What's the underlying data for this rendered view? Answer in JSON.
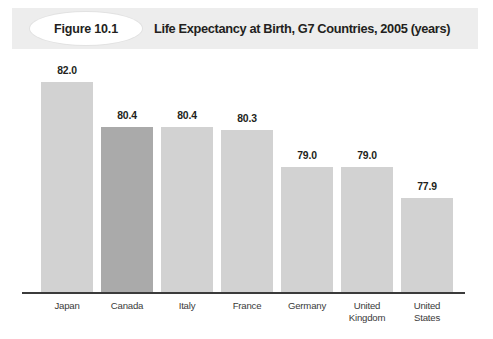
{
  "header": {
    "figure_number": "Figure 10.1",
    "title": "Life Expectancy at Birth, G7 Countries, 2005 (years)",
    "band_color": "#ededed",
    "badge_shape": "ellipse-badge"
  },
  "colors": {
    "bar_default": "#d2d2d2",
    "bar_highlight": "#aaaaaa",
    "axis": "#3b3b3b",
    "text": "#231f20"
  },
  "chart_data": {
    "type": "bar",
    "title": "Life Expectancy at Birth, G7 Countries, 2005 (years)",
    "xlabel": "",
    "ylabel": "",
    "ylim": [
      74.5,
      82.8
    ],
    "grid": false,
    "legend": null,
    "highlight_category": "Canada",
    "categories": [
      "Japan",
      "Canada",
      "Italy",
      "France",
      "Germany",
      "United Kingdom",
      "United States"
    ],
    "category_lines": [
      [
        "Japan"
      ],
      [
        "Canada"
      ],
      [
        "Italy"
      ],
      [
        "France"
      ],
      [
        "Germany"
      ],
      [
        "United",
        "Kingdom"
      ],
      [
        "United",
        "States"
      ]
    ],
    "values": [
      82.0,
      80.4,
      80.4,
      80.3,
      79.0,
      79.0,
      77.9
    ],
    "value_labels": [
      "82.0",
      "80.4",
      "80.4",
      "80.3",
      "79.0",
      "79.0",
      "77.9"
    ]
  }
}
